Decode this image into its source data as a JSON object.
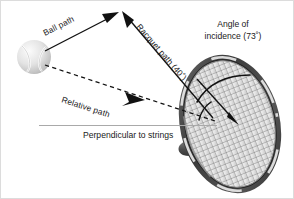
{
  "figure": {
    "background_color": "#ffffff",
    "border_color": "#dcdcdc",
    "ink_color": "#111111",
    "perpendicular_line_color": "#a9a9a9"
  },
  "labels": {
    "ball_path": "Ball path",
    "racquet_path": "Racquet path (40˚)",
    "relative_path": "Relative path",
    "perpendicular": "Perpendicular to strings",
    "angle_of_incidence_line1": "Angle of",
    "angle_of_incidence_line2": "incidence (73˚)"
  },
  "values": {
    "racquet_path_angle": "40˚",
    "angle_of_incidence": "73˚"
  },
  "objects": {
    "ball_name": "tennis-ball",
    "racquet_name": "tennis-racquet"
  }
}
